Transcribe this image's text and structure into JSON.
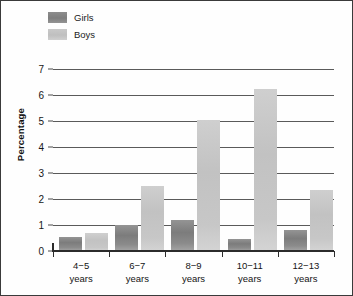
{
  "chart_data": {
    "type": "bar",
    "title": "",
    "subtitle": "",
    "xlabel": "",
    "ylabel": "Percentage",
    "ylim": [
      0,
      7
    ],
    "yticks": [
      0,
      1,
      2,
      3,
      4,
      5,
      6,
      7
    ],
    "grid": true,
    "legend_position": "top-left",
    "categories": [
      "4−5\nyears",
      "6−7\nyears",
      "8−9\nyears",
      "10−11\nyears",
      "12−13\nyears"
    ],
    "category_lines": [
      {
        "range": "4−5",
        "unit": "years"
      },
      {
        "range": "6−7",
        "unit": "years"
      },
      {
        "range": "8−9",
        "unit": "years"
      },
      {
        "range": "10−11",
        "unit": "years"
      },
      {
        "range": "12−13",
        "unit": "years"
      }
    ],
    "series": [
      {
        "name": "Girls",
        "color": "#858585",
        "values": [
          0.55,
          1.0,
          1.2,
          0.45,
          0.8
        ]
      },
      {
        "name": "Boys",
        "color": "#c6c6c6",
        "values": [
          0.7,
          2.5,
          5.05,
          6.25,
          2.35
        ]
      }
    ]
  },
  "legend": {
    "items": [
      {
        "label": "Girls",
        "swatch": "legend-swatch-girls"
      },
      {
        "label": "Boys",
        "swatch": "legend-swatch-boys"
      }
    ]
  },
  "axes": {
    "y_title": "Percentage",
    "y_tick_labels": [
      "7",
      "6",
      "5",
      "4",
      "3",
      "2",
      "1",
      "0"
    ]
  },
  "colors": {
    "girls": "#858585",
    "boys": "#c6c6c6",
    "gridline": "#5a5a5a",
    "axis": "#2b2b2b",
    "frame": "#3a3a3a",
    "text": "#141414",
    "background": "#fefefe"
  }
}
